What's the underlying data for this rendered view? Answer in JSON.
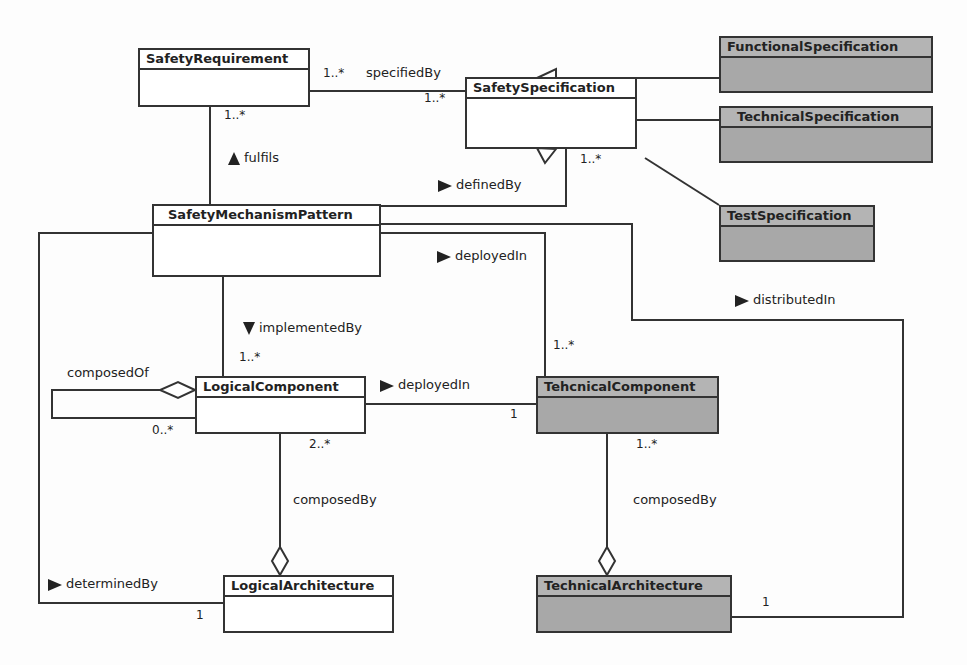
{
  "diagram": {
    "type": "UML class diagram",
    "classes": {
      "safety_requirement": {
        "name": "SafetyRequirement",
        "shaded": false
      },
      "safety_specification": {
        "name": "SafetySpecification",
        "shaded": false
      },
      "functional_specification": {
        "name": "FunctionalSpecification",
        "shaded": true
      },
      "technical_specification": {
        "name": "TechnicalSpecification",
        "shaded": true
      },
      "test_specification": {
        "name": "TestSpecification",
        "shaded": true
      },
      "safety_mechanism_pattern": {
        "name": "SafetyMechanismPattern",
        "shaded": false
      },
      "logical_component": {
        "name": "LogicalComponent",
        "shaded": false
      },
      "technical_component": {
        "name": "TehcnicalComponent",
        "shaded": true
      },
      "logical_architecture": {
        "name": "LogicalArchitecture",
        "shaded": false
      },
      "technical_architecture": {
        "name": "TechnicalArchitecture",
        "shaded": true
      }
    },
    "associations": {
      "specified_by": {
        "label": "specifiedBy",
        "mult_source": "1..*",
        "mult_target": "1..*"
      },
      "fulfils": {
        "label": "fulfils",
        "direction": "up",
        "mult": "1..*"
      },
      "defined_by": {
        "label": "definedBy",
        "direction": "right",
        "mult": "1..*"
      },
      "deployed_in_pattern": {
        "label": "deployedIn",
        "direction": "right",
        "mult": "1..*"
      },
      "distributed_in": {
        "label": "distributedIn",
        "direction": "right",
        "mult": "1"
      },
      "implemented_by": {
        "label": "implementedBy",
        "direction": "down",
        "mult": "1..*"
      },
      "composed_of": {
        "label": "composedOf",
        "mult": "0..*"
      },
      "deployed_in_component": {
        "label": "deployedIn",
        "direction": "right",
        "mult": "1"
      },
      "composed_by_logical": {
        "label": "composedBy",
        "mult": "2..*"
      },
      "composed_by_technical": {
        "label": "composedBy",
        "mult": "1..*"
      },
      "determined_by": {
        "label": "determinedBy",
        "direction": "right",
        "mult": "1"
      }
    },
    "generalizations": [
      "FunctionalSpecification",
      "TechnicalSpecification",
      "TestSpecification"
    ],
    "colors": {
      "line": "#333333",
      "box_fill": "#ffffff",
      "shaded_fill": "#a8a8a8",
      "background": "#fdfdfd"
    }
  }
}
